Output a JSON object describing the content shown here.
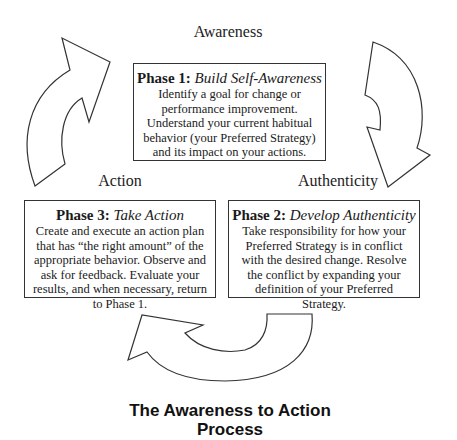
{
  "diagram": {
    "stages": {
      "awareness": "Awareness",
      "action": "Action",
      "authenticity": "Authenticity"
    },
    "phases": [
      {
        "number_label": "Phase 1:",
        "name": "Build Self-Awareness",
        "description": "Identify a goal for change or performance improvement. Understand your current habitual behavior (your Preferred Strategy) and its impact on your actions."
      },
      {
        "number_label": "Phase 2:",
        "name": "Develop Authenticity",
        "description": "Take responsibility for how your Preferred Strategy is in conflict with the desired change. Resolve the conflict by expanding your definition of your Preferred Strategy."
      },
      {
        "number_label": "Phase 3:",
        "name": "Take Action",
        "description": "Create and execute an action plan that has “the right amount” of the appropriate behavior. Observe and ask for feedback. Evaluate your results, and when necessary, return to Phase 1."
      }
    ],
    "caption_line1": "The Awareness to Action",
    "caption_line2": "Process",
    "colors": {
      "stroke": "#333333",
      "fill": "#ffffff",
      "text": "#1a1a1a"
    }
  }
}
